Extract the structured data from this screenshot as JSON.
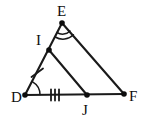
{
  "figure": {
    "stroke_color": "#1a1a1a",
    "label_color": "#0d0d0d",
    "background_color": "#ffffff",
    "width": 143,
    "height": 127
  },
  "vertices": [
    {
      "id": "E",
      "label": "E",
      "x": 62,
      "y": 23,
      "label_x": 57,
      "label_y": 16,
      "has_dot": true
    },
    {
      "id": "I",
      "label": "I",
      "x": 49,
      "y": 50,
      "label_x": 36,
      "label_y": 45,
      "has_dot": true
    },
    {
      "id": "D",
      "label": "D",
      "x": 25,
      "y": 95,
      "label_x": 11,
      "label_y": 102,
      "has_dot": true
    },
    {
      "id": "J",
      "label": "J",
      "x": 87,
      "y": 95,
      "label_x": 82,
      "label_y": 115,
      "has_dot": true
    },
    {
      "id": "F",
      "label": "F",
      "x": 124,
      "y": 94,
      "label_x": 129,
      "label_y": 101,
      "has_dot": true
    }
  ],
  "segments": [
    {
      "id": "DE",
      "from": "D",
      "to": "E",
      "path": "M 25 95 L 62 23"
    },
    {
      "id": "EF",
      "from": "E",
      "to": "F",
      "path": "M 62 23 L 124 94"
    },
    {
      "id": "DF",
      "from": "D",
      "to": "F",
      "path": "M 25 95 L 124 94"
    },
    {
      "id": "IJ",
      "from": "I",
      "to": "J",
      "path": "M 49 50 L 87 95"
    }
  ],
  "angle_marks": [
    {
      "id": "angle-E",
      "vertex": "E",
      "arcs": 2,
      "label": "double-arc angle mark at E"
    },
    {
      "id": "angle-D",
      "vertex": "D",
      "arcs": 1,
      "label": "single-arc angle mark at D"
    }
  ],
  "congruence_ticks": [
    {
      "id": "tick-DI",
      "segment": "DI",
      "count": 1,
      "label": "single tick on segment D-I"
    },
    {
      "id": "tick-DJ",
      "segment": "DJ",
      "count": 3,
      "label": "triple ticks on segment D-J"
    }
  ]
}
